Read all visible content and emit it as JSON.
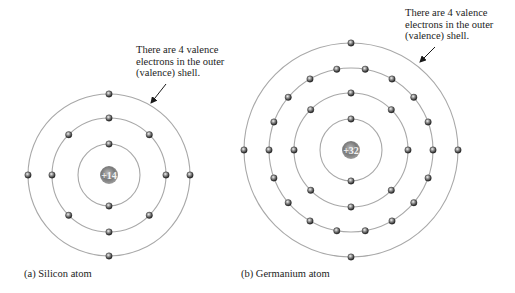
{
  "figure": {
    "atoms": [
      {
        "id": "silicon",
        "caption": "(a) Silicon atom",
        "nucleus_label": "+14",
        "center": [
          109,
          175
        ],
        "shells": [
          {
            "radius": 31,
            "electrons": 2,
            "start_angle": 90
          },
          {
            "radius": 57,
            "electrons": 8,
            "start_angle": 0
          },
          {
            "radius": 81,
            "electrons": 4,
            "start_angle": 0
          }
        ],
        "annotation": {
          "lines": [
            "There are 4 valence",
            "electrons in the outer",
            "(valence) shell."
          ],
          "arrow_from": [
            166,
            84
          ],
          "arrow_to": [
            151,
            103
          ]
        }
      },
      {
        "id": "germanium",
        "caption": "(b) Germanium atom",
        "nucleus_label": "+32",
        "center": [
          351,
          150
        ],
        "shells": [
          {
            "radius": 31,
            "electrons": 2,
            "start_angle": 90
          },
          {
            "radius": 57,
            "electrons": 8,
            "start_angle": 0
          },
          {
            "radius": 82,
            "electrons": 18,
            "start_angle": 0
          },
          {
            "radius": 107,
            "electrons": 4,
            "start_angle": 0
          }
        ],
        "annotation": {
          "lines": [
            "There are 4 valence",
            "electrons in the outer",
            "(valence) shell."
          ],
          "arrow_from": [
            435,
            47
          ],
          "arrow_to": [
            420,
            62
          ]
        }
      }
    ]
  }
}
